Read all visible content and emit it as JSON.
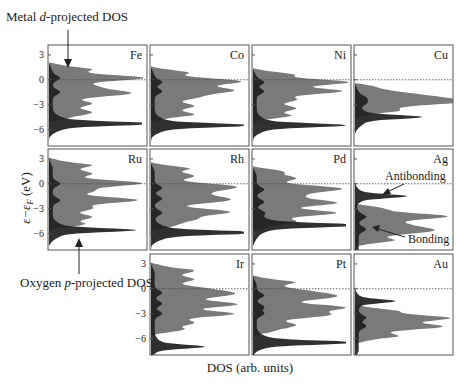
{
  "chart_data": {
    "type": "area",
    "title": "",
    "xlabel": "DOS (arb. units)",
    "ylabel": "ε−ε_F (eV)",
    "ylim": [
      -8,
      4.2
    ],
    "yticks": [
      3,
      0,
      -3,
      -6
    ],
    "fermi_level_line": 0,
    "grid": false,
    "layout": "3x4 panel grid, transition metals in periodic-table arrangement",
    "series_legend": [
      {
        "name": "Metal d-projected DOS",
        "color": "#7a7a7a"
      },
      {
        "name": "Oxygen p-projected DOS",
        "color": "#1e1e1e"
      }
    ],
    "annotations": [
      {
        "text": "Metal d-projected DOS",
        "points_to": "Fe panel metal d-band"
      },
      {
        "text": "Oxygen p-projected DOS",
        "points_to": "Ru panel oxygen p peak"
      },
      {
        "text": "Antibonding",
        "panel": "Ag",
        "energy_eV": -1.5
      },
      {
        "text": "Bonding",
        "panel": "Ag",
        "energy_eV": -6.5
      }
    ],
    "panels": [
      {
        "element": "Fe",
        "row": 0,
        "col": 0,
        "d_peaks_eV": [
          0.2,
          -1.5
        ],
        "d_band_range_eV": [
          1.5,
          -4.5
        ],
        "o_p_peak_eV": -5.3,
        "o_p_peak_height": 0.92
      },
      {
        "element": "Co",
        "row": 0,
        "col": 1,
        "d_peaks_eV": [
          -0.3,
          -1.4
        ],
        "d_band_range_eV": [
          1.0,
          -4.5
        ],
        "o_p_peak_eV": -5.5,
        "o_p_peak_height": 0.85
      },
      {
        "element": "Ni",
        "row": 0,
        "col": 2,
        "d_peaks_eV": [
          -0.3,
          -1.4
        ],
        "d_band_range_eV": [
          0.8,
          -4.5
        ],
        "o_p_peak_eV": -5.5,
        "o_p_peak_height": 0.78
      },
      {
        "element": "Cu",
        "row": 0,
        "col": 3,
        "d_peaks_eV": [
          -2.2,
          -2.8
        ],
        "d_band_range_eV": [
          -1.0,
          -4.0
        ],
        "o_p_peak_eV": -4.5,
        "o_p_peak_height": 0.55
      },
      {
        "element": "Ru",
        "row": 1,
        "col": 0,
        "d_peaks_eV": [
          0.0,
          -2.0
        ],
        "d_band_range_eV": [
          2.5,
          -5.0
        ],
        "o_p_peak_eV": -5.6,
        "o_p_peak_height": 0.72
      },
      {
        "element": "Rh",
        "row": 1,
        "col": 1,
        "d_peaks_eV": [
          -0.5,
          -1.8,
          -3.5
        ],
        "d_band_range_eV": [
          2.0,
          -5.0
        ],
        "o_p_peak_eV": -5.9,
        "o_p_peak_height": 0.98
      },
      {
        "element": "Pd",
        "row": 1,
        "col": 2,
        "d_peaks_eV": [
          -0.7,
          -2.2,
          -3.5
        ],
        "d_band_range_eV": [
          1.5,
          -5.0
        ],
        "o_p_peak_eV": -5.0,
        "o_p_peak_height": 1.0
      },
      {
        "element": "Ag",
        "row": 1,
        "col": 3,
        "d_peaks_eV": [
          -4.0,
          -5.5
        ],
        "d_band_range_eV": [
          -3.0,
          -7.0
        ],
        "o_p_peak_eV": -1.5,
        "o_p_peak_height": 0.45
      },
      {
        "element": "Ir",
        "row": 2,
        "col": 1,
        "d_peaks_eV": [
          -0.5,
          -1.8,
          -3.0
        ],
        "d_band_range_eV": [
          2.5,
          -5.0
        ],
        "o_p_peak_eV": -7.0,
        "o_p_peak_height": 0.45
      },
      {
        "element": "Pt",
        "row": 2,
        "col": 2,
        "d_peaks_eV": [
          -0.8,
          -2.2,
          -3.0
        ],
        "d_band_range_eV": [
          1.0,
          -5.0
        ],
        "o_p_peak_eV": -6.5,
        "o_p_peak_height": 0.9
      },
      {
        "element": "Au",
        "row": 2,
        "col": 3,
        "d_peaks_eV": [
          -3.5,
          -4.5
        ],
        "d_band_range_eV": [
          -2.5,
          -6.0
        ],
        "o_p_peak_eV": -1.5,
        "o_p_peak_height": 0.35
      }
    ]
  },
  "labels": {
    "metal_d": "Metal d-projected DOS",
    "metal_d_pre": "Metal ",
    "metal_d_ital": "d",
    "metal_d_post": "-projected DOS",
    "oxygen_p_pre": "Oxygen ",
    "oxygen_p_ital": "p",
    "oxygen_p_post": "-projected DOS",
    "xlabel": "DOS (arb. units)",
    "ylabel": "ε−ε",
    "ylabel_sub": "F",
    "ylabel_unit": " (eV)",
    "antibonding": "Antibonding",
    "bonding": "Bonding",
    "ticks": [
      "3",
      "0",
      "−3",
      "−6"
    ]
  }
}
